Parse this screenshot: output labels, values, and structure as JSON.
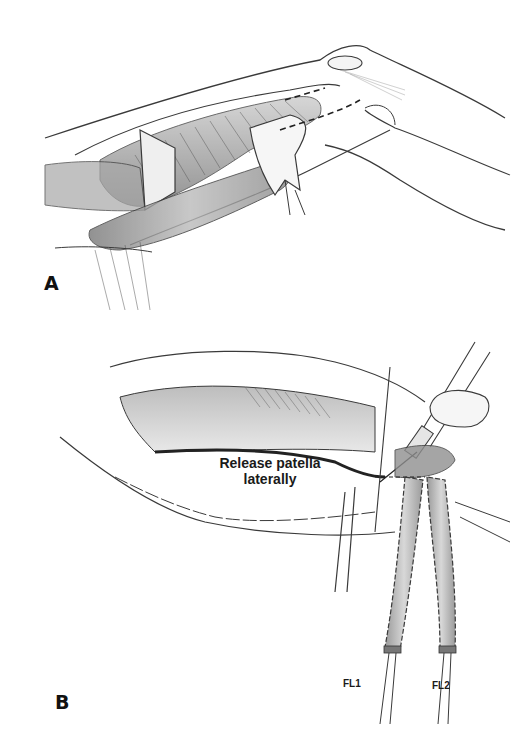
{
  "figure": {
    "panels": [
      {
        "id": "A",
        "label": "A",
        "description": "Medial parapatellar exposure of the knee: quadriceps tendon, patella, reflected flap with dashed incision line"
      },
      {
        "id": "B",
        "label": "B",
        "description": "Lateral release of the patella with instrument; two suture-whipstitched graft limbs exiting below",
        "annotations": {
          "release_line1": "Release patella",
          "release_line2": "laterally",
          "graft_limb_1": "FL1",
          "graft_limb_2": "FL2"
        }
      }
    ],
    "colors": {
      "background": "#ffffff",
      "line": "#3a3a3a",
      "shading": "#8a8a8a",
      "text": "#111111"
    }
  }
}
